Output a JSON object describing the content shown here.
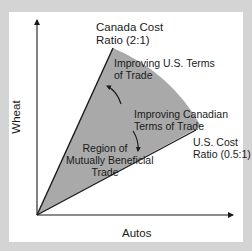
{
  "diagram": {
    "axes": {
      "x_label": "Autos",
      "y_label": "Wheat"
    },
    "lines": {
      "canada_cost_ratio": {
        "label_line1": "Canada Cost",
        "label_line2": "Ratio (2:1)"
      },
      "us_cost_ratio": {
        "label_line1": "U.S. Cost",
        "label_line2": "Ratio (0.5:1)"
      }
    },
    "annotations": {
      "improving_us": {
        "line1": "Improving U.S. Terms",
        "line2": "of Trade"
      },
      "improving_canadian": {
        "line1": "Improving Canadian",
        "line2": "Terms of Trade"
      },
      "region": {
        "line1": "Region of",
        "line2": "Mutually Beneficial",
        "line3": "Trade"
      }
    },
    "colors": {
      "background": "#d4d4d4",
      "panel": "#ffffff",
      "region_fill": "#a9a9a9",
      "lines": "#1a1a1a"
    }
  }
}
